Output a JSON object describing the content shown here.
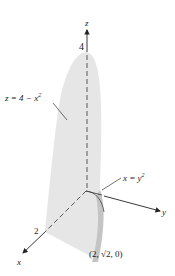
{
  "figure": {
    "type": "3d-solid-region",
    "axes": {
      "z": {
        "label": "z",
        "tick_label": "4"
      },
      "y": {
        "label": "y"
      },
      "x": {
        "label": "x",
        "tick_label": "2"
      }
    },
    "surfaces": [
      {
        "name": "parabolic-cylinder-top",
        "label_lhs": "z = 4 − x",
        "label_sup": "2"
      },
      {
        "name": "parabolic-cylinder-side",
        "label_lhs": "x = y",
        "label_sup": "2"
      }
    ],
    "points": [
      {
        "label_pre": "(2, ",
        "label_sqrt": "2",
        "label_post": ", 0)"
      }
    ],
    "colors": {
      "solid_fill": "#e6e6e6",
      "solid_shade": "#c8c8c8",
      "axis": "#222222",
      "background": "#ffffff"
    }
  }
}
